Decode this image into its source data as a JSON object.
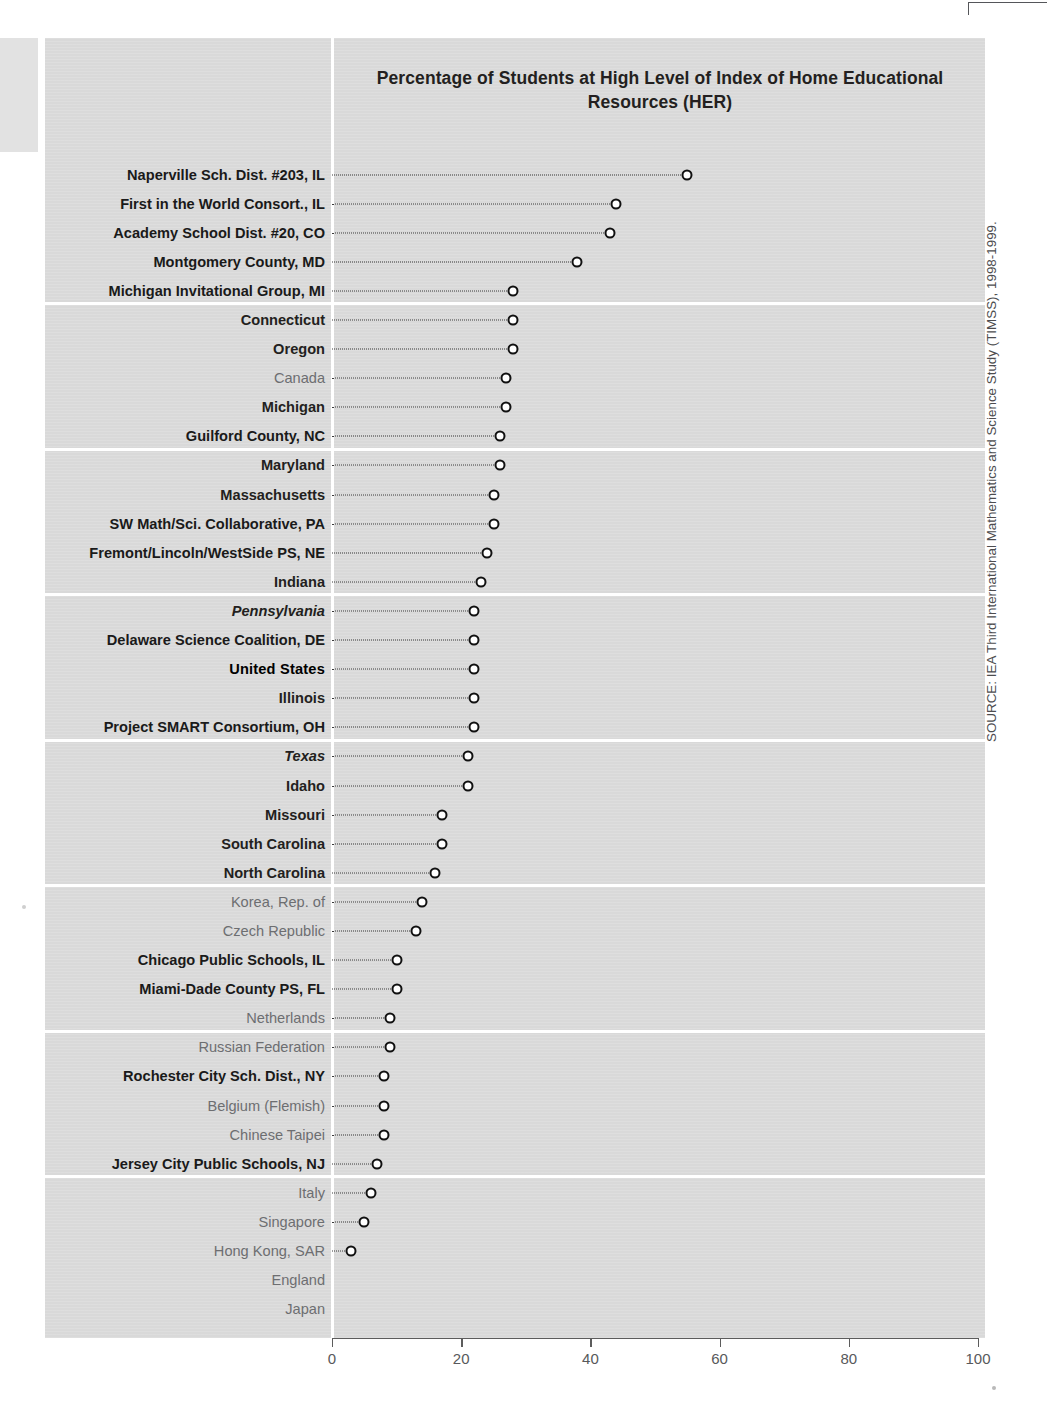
{
  "chart_data": {
    "type": "scatter",
    "title": "Percentage of Students at High Level of Index of Home Educational Resources (HER)",
    "xlabel": "",
    "ylabel": "",
    "xlim": [
      0,
      100
    ],
    "grid": false,
    "legend": "none",
    "orientation": "horizontal-dot-plot",
    "tick_labels": [
      "0",
      "20",
      "40",
      "60",
      "80",
      "100"
    ],
    "tick_values": [
      0,
      20,
      40,
      60,
      80,
      100
    ],
    "categories": [
      "Naperville Sch. Dist. #203, IL",
      "First in the World Consort., IL",
      "Academy School Dist. #20, CO",
      "Montgomery County, MD",
      "Michigan Invitational Group, MI",
      "Connecticut",
      "Oregon",
      "Canada",
      "Michigan",
      "Guilford County, NC",
      "Maryland",
      "Massachusetts",
      "SW Math/Sci. Collaborative, PA",
      "Fremont/Lincoln/WestSide PS, NE",
      "Indiana",
      "Pennsylvania",
      "Delaware Science Coalition, DE",
      "United States",
      "Illinois",
      "Project SMART Consortium, OH",
      "Texas",
      "Idaho",
      "Missouri",
      "South Carolina",
      "North Carolina",
      "Korea, Rep. of",
      "Czech Republic",
      "Chicago Public Schools, IL",
      "Miami-Dade County PS, FL",
      "Netherlands",
      "Russian Federation",
      "Rochester City Sch. Dist., NY",
      "Belgium (Flemish)",
      "Chinese Taipei",
      "Jersey City Public Schools, NJ",
      "Italy",
      "Singapore",
      "Hong Kong, SAR",
      "England",
      "Japan"
    ],
    "values": [
      55,
      44,
      43,
      38,
      28,
      28,
      28,
      27,
      27,
      26,
      26,
      25,
      25,
      24,
      23,
      22,
      22,
      22,
      22,
      22,
      21,
      21,
      17,
      17,
      16,
      14,
      13,
      10,
      10,
      9,
      9,
      8,
      8,
      8,
      7,
      6,
      5,
      3,
      0,
      0
    ],
    "label_styles": [
      "benchmark",
      "benchmark",
      "benchmark",
      "benchmark",
      "benchmark",
      "state",
      "state",
      "nation",
      "state",
      "benchmark",
      "state",
      "state",
      "benchmark",
      "benchmark",
      "state",
      "state-italic",
      "benchmark",
      "us",
      "state",
      "benchmark",
      "state-italic",
      "state",
      "state",
      "state",
      "state",
      "nation",
      "nation",
      "benchmark",
      "benchmark",
      "nation",
      "nation",
      "benchmark",
      "nation",
      "nation",
      "benchmark",
      "nation",
      "nation",
      "nation",
      "nation",
      "nation"
    ],
    "group_breaks": [
      5,
      10,
      15,
      20,
      25,
      30,
      35
    ],
    "marker_style": "open-circle",
    "leader_style": "dotted"
  },
  "source": {
    "note": "SOURCE: IEA Third International Mathematics and Science Study (TIMSS), 1998-1999."
  },
  "colors": {
    "panel_background": "#d9d9d9",
    "marker_outline": "#111111",
    "marker_fill": "#ffffff",
    "label_dark": "#231f20",
    "label_light": "#6d6e71",
    "axis": "#5c5c5c",
    "separator": "#ffffff"
  }
}
